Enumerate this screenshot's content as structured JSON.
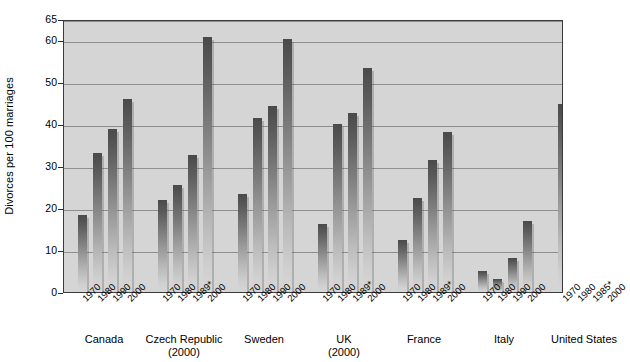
{
  "chart_data": {
    "type": "bar",
    "title": "",
    "xlabel": "",
    "ylabel": "Divorces per 100 marriages",
    "ylim": [
      0,
      65
    ],
    "yticks": [
      0,
      10,
      20,
      30,
      40,
      50,
      60,
      65
    ],
    "ytick_labels": [
      "0",
      "10",
      "20",
      "30",
      "40",
      "50",
      "60",
      "65"
    ],
    "grid": true,
    "legend": "none",
    "groups": [
      {
        "name": "Canada",
        "sub": "",
        "categories": [
          "1970",
          "1980",
          "1990",
          "2000"
        ],
        "values": [
          18.3,
          33.0,
          38.7,
          46.0
        ]
      },
      {
        "name": "Czech Republic",
        "sub": "(2000)",
        "categories": [
          "1970",
          "1980",
          "1989*",
          "2000"
        ],
        "values": [
          22.0,
          25.5,
          32.7,
          60.7
        ]
      },
      {
        "name": "Sweden",
        "sub": "",
        "categories": [
          "1970",
          "1980",
          "1990",
          "2000"
        ],
        "values": [
          23.4,
          41.5,
          44.2,
          60.3
        ]
      },
      {
        "name": "UK",
        "sub": "(2000)",
        "categories": [
          "1970",
          "1980",
          "1989*",
          "2000"
        ],
        "values": [
          16.3,
          40.0,
          42.7,
          53.3
        ]
      },
      {
        "name": "France",
        "sub": "",
        "categories": [
          "1970",
          "1980",
          "1989*",
          "2000"
        ],
        "values": [
          12.3,
          22.4,
          31.5,
          38.1
        ]
      },
      {
        "name": "Italy",
        "sub": "",
        "categories": [
          "1970",
          "1980",
          "1990",
          "2000"
        ],
        "values": [
          5.0,
          3.2,
          8.1,
          16.8
        ]
      },
      {
        "name": "United States",
        "sub": "",
        "categories": [
          "1970",
          "1980",
          "1985*",
          "2000"
        ],
        "values": [
          44.8,
          58.6,
          55.3,
          50.0
        ]
      }
    ]
  },
  "style": {
    "plot_background": "#d5d5d5",
    "gridline_color": "#8f8f8f",
    "axis_color": "#3a3a3a",
    "bar_top_color": "#4a4a4a",
    "bar_bottom_color": "#d6d6d6",
    "text_color": "#000000"
  }
}
